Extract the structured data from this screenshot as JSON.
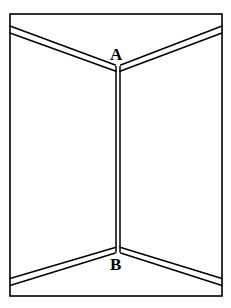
{
  "figure": {
    "background_color": "#ffffff",
    "line_color": "#000000",
    "labels": {
      "top": "A",
      "bottom": "B"
    },
    "border": {
      "name": "outer-frame",
      "x": 10,
      "y": 14,
      "width": 212,
      "height": 282,
      "stroke_width": 1.6
    },
    "geometry": {
      "corner_x": 118,
      "vertex_top_y": 68,
      "vertex_bottom_y": 250,
      "ceiling_left_y": 29,
      "ceiling_right_y": 29,
      "floor_left_y": 283,
      "floor_right_y": 283,
      "left_edge_x": 10,
      "right_edge_x": 222,
      "double_line_gap": 3.2,
      "stroke_width": 1.5
    }
  }
}
